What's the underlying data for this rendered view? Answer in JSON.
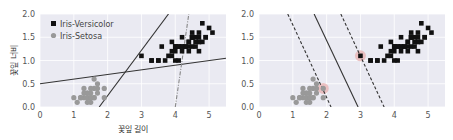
{
  "chart_data": [
    {
      "type": "scatter",
      "title": "",
      "xlabel": "꽃잎 길이",
      "ylabel": "꽃잎 너비",
      "xlim": [
        0,
        5.5
      ],
      "ylim": [
        0,
        2.0
      ],
      "xticks": [
        "0",
        "1",
        "2",
        "3",
        "4",
        "5"
      ],
      "yticks": [
        "0.0",
        "0.5",
        "1.0",
        "1.5",
        "2.0"
      ],
      "grid": true,
      "legend_position": "upper left",
      "legend": [
        {
          "label": "Iris-Versicolor",
          "marker": "square",
          "color": "#111111"
        },
        {
          "label": "Iris-Setosa",
          "marker": "circle",
          "color": "#999999"
        }
      ],
      "series": [
        {
          "name": "Iris-Versicolor",
          "marker": "square",
          "color": "#111111",
          "points": [
            [
              4.7,
              1.4
            ],
            [
              4.5,
              1.5
            ],
            [
              4.9,
              1.5
            ],
            [
              4.0,
              1.3
            ],
            [
              4.6,
              1.5
            ],
            [
              4.5,
              1.3
            ],
            [
              4.7,
              1.6
            ],
            [
              3.3,
              1.0
            ],
            [
              4.6,
              1.3
            ],
            [
              3.9,
              1.4
            ],
            [
              3.5,
              1.0
            ],
            [
              4.2,
              1.5
            ],
            [
              4.0,
              1.0
            ],
            [
              4.7,
              1.4
            ],
            [
              3.6,
              1.3
            ],
            [
              4.4,
              1.4
            ],
            [
              4.5,
              1.5
            ],
            [
              4.1,
              1.0
            ],
            [
              4.5,
              1.5
            ],
            [
              3.9,
              1.1
            ],
            [
              4.8,
              1.8
            ],
            [
              4.0,
              1.3
            ],
            [
              4.9,
              1.5
            ],
            [
              4.7,
              1.2
            ],
            [
              4.3,
              1.3
            ],
            [
              4.4,
              1.4
            ],
            [
              4.8,
              1.4
            ],
            [
              5.0,
              1.7
            ],
            [
              4.5,
              1.5
            ],
            [
              3.5,
              1.0
            ],
            [
              3.8,
              1.1
            ],
            [
              3.7,
              1.0
            ],
            [
              3.9,
              1.2
            ],
            [
              5.1,
              1.6
            ],
            [
              4.5,
              1.5
            ],
            [
              4.5,
              1.6
            ],
            [
              4.7,
              1.5
            ],
            [
              4.4,
              1.3
            ],
            [
              4.1,
              1.3
            ],
            [
              4.0,
              1.3
            ],
            [
              4.4,
              1.2
            ],
            [
              4.6,
              1.4
            ],
            [
              4.0,
              1.2
            ],
            [
              3.3,
              1.0
            ],
            [
              4.2,
              1.3
            ],
            [
              4.2,
              1.2
            ],
            [
              4.2,
              1.3
            ],
            [
              4.3,
              1.3
            ],
            [
              3.0,
              1.1
            ],
            [
              4.1,
              1.3
            ]
          ]
        },
        {
          "name": "Iris-Setosa",
          "marker": "circle",
          "color": "#999999",
          "points": [
            [
              1.4,
              0.2
            ],
            [
              1.3,
              0.2
            ],
            [
              1.5,
              0.2
            ],
            [
              1.7,
              0.4
            ],
            [
              1.4,
              0.3
            ],
            [
              1.5,
              0.1
            ],
            [
              1.6,
              0.2
            ],
            [
              1.1,
              0.1
            ],
            [
              1.2,
              0.2
            ],
            [
              1.3,
              0.4
            ],
            [
              1.7,
              0.3
            ],
            [
              1.5,
              0.3
            ],
            [
              1.0,
              0.2
            ],
            [
              1.7,
              0.5
            ],
            [
              1.9,
              0.2
            ],
            [
              1.6,
              0.4
            ],
            [
              1.5,
              0.4
            ],
            [
              1.4,
              0.1
            ],
            [
              1.2,
              0.2
            ],
            [
              1.6,
              0.6
            ],
            [
              1.9,
              0.4
            ],
            [
              1.4,
              0.3
            ],
            [
              1.6,
              0.2
            ],
            [
              1.3,
              0.3
            ],
            [
              1.5,
              0.2
            ]
          ]
        }
      ],
      "lines": [
        {
          "name": "bad-model-1",
          "style": "solid",
          "color": "#333333",
          "from": [
            1.75,
            0.0
          ],
          "to": [
            3.8,
            2.0
          ]
        },
        {
          "name": "bad-model-2",
          "style": "solid",
          "color": "#333333",
          "from": [
            0.0,
            0.5
          ],
          "to": [
            5.5,
            1.05
          ]
        },
        {
          "name": "bad-model-3",
          "style": "dashdot",
          "color": "#888888",
          "from": [
            4.0,
            0.0
          ],
          "to": [
            4.4,
            2.0
          ]
        }
      ]
    },
    {
      "type": "scatter",
      "title": "",
      "xlabel": "",
      "ylabel": "",
      "xlim": [
        0,
        5.5
      ],
      "ylim": [
        0,
        2.0
      ],
      "xticks": [
        "0",
        "1",
        "2",
        "3",
        "4",
        "5"
      ],
      "yticks": [
        "0.0",
        "0.5",
        "1.0",
        "1.5",
        "2.0"
      ],
      "grid": true,
      "series": [
        {
          "name": "Iris-Versicolor",
          "marker": "square",
          "color": "#111111",
          "ref": "same as left"
        },
        {
          "name": "Iris-Setosa",
          "marker": "circle",
          "color": "#999999",
          "ref": "same as left"
        }
      ],
      "support_vectors": [
        [
          3.0,
          1.1
        ],
        [
          1.9,
          0.4
        ]
      ],
      "lines": [
        {
          "name": "decision-boundary",
          "style": "solid",
          "color": "#333333",
          "from": [
            1.63,
            2.0
          ],
          "to": [
            2.93,
            0.0
          ]
        },
        {
          "name": "margin-lower",
          "style": "dashed",
          "color": "#333333",
          "from": [
            0.85,
            2.0
          ],
          "to": [
            2.13,
            0.0
          ]
        },
        {
          "name": "margin-upper",
          "style": "dashed",
          "color": "#333333",
          "from": [
            2.42,
            2.0
          ],
          "to": [
            3.7,
            0.0
          ]
        }
      ]
    }
  ],
  "colors": {
    "plot_bg": "#eaeaf2",
    "grid": "#ffffff",
    "versicolor": "#111111",
    "setosa": "#999999",
    "support_vector_halo": "#e8b4b4"
  }
}
